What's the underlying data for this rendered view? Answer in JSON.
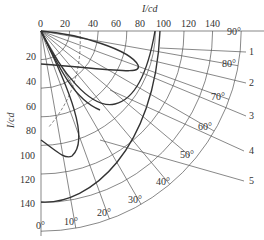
{
  "diagram": {
    "type": "polar-intensity-distribution",
    "unit_label_top": "I/cd",
    "unit_label_left": "I/cd",
    "radial_ticks": [
      "0",
      "20",
      "40",
      "60",
      "80",
      "100",
      "120",
      "140"
    ],
    "vertical_ticks": [
      "20",
      "40",
      "60",
      "80",
      "100",
      "120",
      "140"
    ],
    "angle_labels": [
      "0°",
      "10°",
      "20°",
      "30°",
      "40°",
      "50°",
      "60°",
      "70°",
      "80°",
      "90°"
    ],
    "curve_labels": [
      "1",
      "2",
      "3",
      "4",
      "5"
    ],
    "colors": {
      "line": "#333333",
      "grid": "#555555",
      "background": "#ffffff"
    }
  }
}
